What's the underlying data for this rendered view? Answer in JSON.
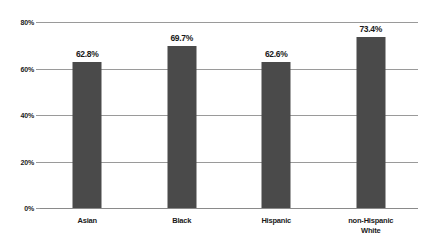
{
  "chart_data": {
    "type": "bar",
    "title": "",
    "subtitle": "",
    "xlabel": "",
    "ylabel": "",
    "categories": [
      "Asian",
      "Black",
      "Hispanic",
      "non-Hispanic\nWhite"
    ],
    "values": [
      62.8,
      69.7,
      62.6,
      73.4
    ],
    "value_labels": [
      "62.8%",
      "69.7%",
      "62.6%",
      "73.4%"
    ],
    "ylim": [
      0,
      80
    ],
    "ytick_values": [
      0,
      20,
      40,
      60,
      80
    ],
    "ytick_labels": [
      "0%",
      "20%",
      "40%",
      "60%",
      "80%"
    ],
    "grid": true,
    "grid_axis": "y",
    "legend": false,
    "legend_position": "none",
    "bar_color": "#4a4a4a",
    "gridline_color": "#9a9a9a",
    "text_color": "#1a1a1a",
    "background_color": "#ffffff"
  }
}
